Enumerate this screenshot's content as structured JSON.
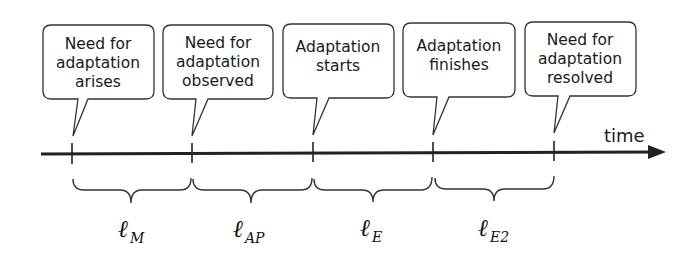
{
  "diagram": {
    "type": "timeline",
    "axis_label": "time",
    "colors": {
      "stroke": "#222222",
      "text": "#1a1a1a",
      "background": "#ffffff"
    },
    "events": [
      {
        "id": "e1",
        "lines": [
          "Need for",
          "adaptation",
          "arises"
        ],
        "x": 72
      },
      {
        "id": "e2",
        "lines": [
          "Need for",
          "adaptation",
          "observed"
        ],
        "x": 192
      },
      {
        "id": "e3",
        "lines": [
          "Adaptation",
          "starts"
        ],
        "x": 313
      },
      {
        "id": "e4",
        "lines": [
          "Adaptation",
          "finishes"
        ],
        "x": 433
      },
      {
        "id": "e5",
        "lines": [
          "Need for",
          "adaptation",
          "resolved"
        ],
        "x": 554
      }
    ],
    "intervals": [
      {
        "symbol": "ℓ",
        "subscript": "M",
        "from": "e1",
        "to": "e2"
      },
      {
        "symbol": "ℓ",
        "subscript": "AP",
        "from": "e2",
        "to": "e3"
      },
      {
        "symbol": "ℓ",
        "subscript": "E",
        "from": "e3",
        "to": "e4"
      },
      {
        "symbol": "ℓ",
        "subscript": "E2",
        "from": "e4",
        "to": "e5"
      }
    ]
  }
}
